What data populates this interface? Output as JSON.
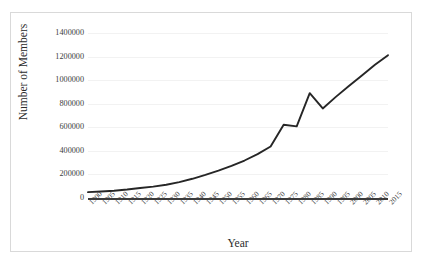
{
  "chart_data": {
    "type": "line",
    "title": "",
    "xlabel": "Year",
    "ylabel": "Number of Members",
    "grid": true,
    "legend": false,
    "xlim": [
      1900,
      2015
    ],
    "ylim": [
      0,
      1400000
    ],
    "yticks": [
      0,
      200000,
      400000,
      600000,
      800000,
      1000000,
      1200000,
      1400000
    ],
    "ytick_labels": [
      "0",
      "200000",
      "400000",
      "600000",
      "800000",
      "1000000",
      "1200000",
      "1400000"
    ],
    "categories": [
      "1900",
      "1905",
      "1910",
      "1915",
      "1920",
      "1925",
      "1930",
      "1935",
      "1940",
      "1945",
      "1950",
      "1955",
      "1960",
      "1965",
      "1970",
      "1975",
      "1980",
      "1985",
      "1990",
      "1995",
      "2000",
      "2005",
      "2010",
      "2015"
    ],
    "series": [
      {
        "name": "Number of Members",
        "color": "#262626",
        "values": [
          50000,
          55000,
          62000,
          72000,
          85000,
          97000,
          112000,
          135000,
          163000,
          196000,
          232000,
          272000,
          318000,
          372000,
          437000,
          622000,
          608000,
          890000,
          760000,
          858000,
          950000,
          1040000,
          1130000,
          1212000
        ]
      }
    ]
  },
  "style": {
    "line_color": "#262626",
    "grid_color": "#f2f2f2",
    "axis_color": "#3a3a3a",
    "border_color": "#d9d9d9",
    "text_color": "#404040",
    "background": "#ffffff"
  }
}
